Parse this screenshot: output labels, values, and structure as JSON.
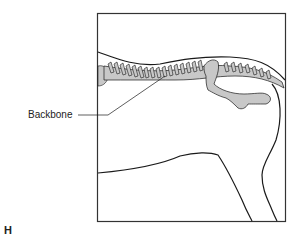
{
  "figure": {
    "letter": "H",
    "labels": [
      {
        "id": "backbone",
        "text": "Backbone"
      }
    ]
  },
  "colors": {
    "outline": "#1a1a1a",
    "bone_fill": "#c8c8c8",
    "frame": "#333333",
    "background": "#ffffff"
  }
}
